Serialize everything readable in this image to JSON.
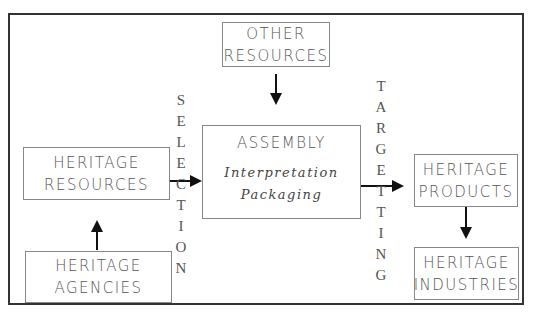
{
  "diagram": {
    "nodes": {
      "other_resources": {
        "lines": [
          "OTHER",
          "RESOURCES"
        ]
      },
      "assembly": {
        "title": "ASSEMBLY",
        "sublines": [
          "Interpretation",
          "Packaging"
        ]
      },
      "heritage_resources": {
        "lines": [
          "HERITAGE",
          "RESOURCES"
        ]
      },
      "heritage_agencies": {
        "lines": [
          "HERITAGE",
          "AGENCIES"
        ]
      },
      "heritage_products": {
        "lines": [
          "HERITAGE",
          "PRODUCTS"
        ]
      },
      "heritage_industries": {
        "lines": [
          "HERITAGE",
          "INDUSTRIES"
        ]
      }
    },
    "labels": {
      "selection": [
        "S",
        "E",
        "L",
        "E",
        "C",
        "T",
        "I",
        "O",
        "N"
      ],
      "targetting": [
        "T",
        "A",
        "R",
        "G",
        "E",
        "T",
        "T",
        "I",
        "N",
        "G"
      ]
    },
    "edges": [
      {
        "from": "heritage_agencies",
        "to": "heritage_resources"
      },
      {
        "from": "heritage_resources",
        "to": "assembly",
        "label": "SELECTION"
      },
      {
        "from": "other_resources",
        "to": "assembly"
      },
      {
        "from": "assembly",
        "to": "heritage_products",
        "label": "TARGETTING"
      },
      {
        "from": "heritage_products",
        "to": "heritage_industries"
      }
    ]
  }
}
